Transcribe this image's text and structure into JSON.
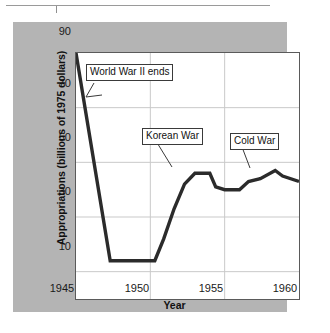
{
  "figure": {
    "background_color": "#b4b4b4",
    "plot_background_color": "#ffffff",
    "line_color": "#2b2b2b",
    "grid_color": "#c9c9c9"
  },
  "chart_data": {
    "type": "line",
    "title": "",
    "xlabel": "Year",
    "ylabel": "Appropriations (billions of 1975 dollars)",
    "xlim": [
      1945,
      1960
    ],
    "ylim": [
      0,
      90
    ],
    "xticks": [
      1945,
      1950,
      1955,
      1960
    ],
    "yticks": [
      10,
      30,
      50,
      70,
      90
    ],
    "xtick_labels": [
      "1945",
      "1950",
      "1955",
      "1960"
    ],
    "ytick_labels": [
      "10",
      "30",
      "50",
      "70",
      "90"
    ],
    "grid": true,
    "legend": "none",
    "series": [
      {
        "name": "Appropriations",
        "x": [
          1945,
          1947.3,
          1950.3,
          1950.9,
          1951.6,
          1952.3,
          1953.0,
          1954.0,
          1954.4,
          1955.0,
          1956.0,
          1956.6,
          1957.4,
          1958.4,
          1958.9,
          1960.0
        ],
        "values": [
          90,
          14,
          14,
          22,
          33,
          42,
          46,
          46,
          41,
          40,
          40,
          43,
          44,
          47,
          45,
          43
        ]
      }
    ],
    "annotations": [
      {
        "label": "World War II ends",
        "box_x": 72,
        "box_y": 41,
        "points_to_x": 1945.9,
        "points_to_y": 70
      },
      {
        "label": "Korean War",
        "box_x": 128,
        "box_y": 105,
        "points_to_x": 1952.9,
        "points_to_y": 46
      },
      {
        "label": "Cold War",
        "box_x": 216,
        "box_y": 110,
        "points_to_x": 1958.3,
        "points_to_y": 47
      }
    ]
  }
}
